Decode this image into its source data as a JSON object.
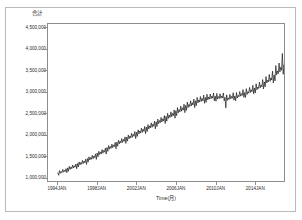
{
  "chart_data": {
    "type": "line",
    "title": "",
    "ylabel": "合計",
    "xlabel": "Time(月)",
    "grid": false,
    "legend": "none",
    "line_color": "#1a1a1a",
    "frame_color": "#8d8d8d",
    "ylim": [
      900000,
      4600000
    ],
    "yticks": [
      1000000,
      1500000,
      2000000,
      2500000,
      3000000,
      3500000,
      4000000,
      4500000
    ],
    "ytick_labels": [
      "1,000,000",
      "1,500,000",
      "2,000,000",
      "2,500,000",
      "3,000,000",
      "3,500,000",
      "4,000,000",
      "4,500,000"
    ],
    "xticks": [
      "1994JAN",
      "1998JAN",
      "2002JAN",
      "2006JAN",
      "2010JAN",
      "2014JAN"
    ],
    "xlim": [
      "1993JAN",
      "2016DEC"
    ],
    "x_start_year": 1993,
    "x_end_year": 2017,
    "values": [
      1090000,
      1035000,
      1145000,
      1080000,
      1125000,
      1095000,
      1175000,
      1110000,
      1150000,
      1120000,
      1190000,
      1095000,
      1210000,
      1130000,
      1245000,
      1175000,
      1230000,
      1190000,
      1275000,
      1205000,
      1260000,
      1225000,
      1300000,
      1190000,
      1315000,
      1230000,
      1350000,
      1280000,
      1335000,
      1295000,
      1385000,
      1310000,
      1370000,
      1330000,
      1415000,
      1290000,
      1430000,
      1345000,
      1470000,
      1395000,
      1455000,
      1410000,
      1505000,
      1425000,
      1490000,
      1450000,
      1540000,
      1410000,
      1560000,
      1470000,
      1600000,
      1520000,
      1585000,
      1540000,
      1640000,
      1555000,
      1620000,
      1580000,
      1675000,
      1535000,
      1690000,
      1600000,
      1735000,
      1650000,
      1715000,
      1670000,
      1770000,
      1685000,
      1750000,
      1710000,
      1810000,
      1660000,
      1815000,
      1720000,
      1860000,
      1775000,
      1840000,
      1795000,
      1900000,
      1810000,
      1880000,
      1835000,
      1940000,
      1785000,
      1935000,
      1840000,
      1985000,
      1895000,
      1960000,
      1915000,
      2025000,
      1930000,
      2000000,
      1955000,
      2065000,
      1900000,
      2050000,
      1950000,
      2105000,
      2010000,
      2080000,
      2030000,
      2145000,
      2045000,
      2120000,
      2070000,
      2185000,
      2015000,
      2170000,
      2065000,
      2230000,
      2125000,
      2200000,
      2150000,
      2270000,
      2165000,
      2240000,
      2190000,
      2310000,
      2130000,
      2295000,
      2185000,
      2360000,
      2250000,
      2325000,
      2275000,
      2400000,
      2290000,
      2365000,
      2315000,
      2440000,
      2255000,
      2425000,
      2310000,
      2495000,
      2375000,
      2455000,
      2400000,
      2530000,
      2415000,
      2495000,
      2440000,
      2575000,
      2380000,
      2555000,
      2440000,
      2630000,
      2505000,
      2585000,
      2530000,
      2665000,
      2545000,
      2625000,
      2570000,
      2710000,
      2510000,
      2680000,
      2565000,
      2760000,
      2630000,
      2705000,
      2655000,
      2790000,
      2670000,
      2745000,
      2690000,
      2830000,
      2630000,
      2790000,
      2675000,
      2870000,
      2740000,
      2810000,
      2760000,
      2890000,
      2775000,
      2845000,
      2790000,
      2925000,
      2730000,
      2870000,
      2755000,
      2945000,
      2810000,
      2880000,
      2830000,
      2950000,
      2840000,
      2900000,
      2850000,
      2975000,
      2790000,
      2900000,
      2780000,
      2965000,
      2830000,
      2890000,
      2845000,
      2955000,
      2850000,
      2905000,
      2855000,
      2975000,
      2790000,
      2870000,
      2625000,
      2930000,
      2800000,
      2860000,
      2820000,
      2940000,
      2835000,
      2895000,
      2850000,
      2980000,
      2805000,
      2905000,
      2790000,
      2985000,
      2855000,
      2920000,
      2885000,
      3010000,
      2900000,
      2960000,
      2915000,
      3055000,
      2870000,
      2985000,
      2870000,
      3075000,
      2940000,
      3005000,
      2970000,
      3105000,
      2985000,
      3050000,
      3005000,
      3155000,
      2955000,
      3090000,
      2975000,
      3190000,
      3050000,
      3115000,
      3080000,
      3230000,
      3095000,
      3165000,
      3120000,
      3290000,
      3070000,
      3235000,
      3120000,
      3360000,
      3210000,
      3275000,
      3235000,
      3410000,
      3250000,
      3330000,
      3280000,
      3490000,
      3210000,
      3400000,
      3260000,
      3620000,
      3400000,
      3495000,
      3430000,
      3680000,
      3470000,
      3580000,
      3510000,
      3905000,
      3415000,
      3640000,
      3485000,
      3900000,
      3690000,
      3770000,
      3700000,
      3960000,
      3745000,
      3845000,
      3790000,
      4090000,
      3680000,
      3880000,
      3740000,
      4150000,
      3950000,
      4025000,
      3985000,
      4210000,
      4020000,
      4110000,
      4070000,
      4405000,
      3960000
    ]
  }
}
